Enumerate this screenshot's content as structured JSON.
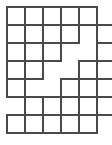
{
  "figure": {
    "name": "staircase-grid-polyomino",
    "type": "grid-puzzle",
    "background_color": "#ffffff",
    "stroke_color": "#4a4a4a",
    "cell_fill_color": "#ffffff",
    "stroke_width": 2,
    "cell_size": 18,
    "origin_x": 7,
    "origin_y": 7,
    "columns": 6,
    "rows": 7,
    "cell_count": 30,
    "cells": [
      {
        "row": 1,
        "col": 1
      },
      {
        "row": 1,
        "col": 2
      },
      {
        "row": 1,
        "col": 3
      },
      {
        "row": 1,
        "col": 4
      },
      {
        "row": 1,
        "col": 5
      },
      {
        "row": 2,
        "col": 1
      },
      {
        "row": 2,
        "col": 2
      },
      {
        "row": 2,
        "col": 3
      },
      {
        "row": 2,
        "col": 4
      },
      {
        "row": 2,
        "col": 6
      },
      {
        "row": 3,
        "col": 1
      },
      {
        "row": 3,
        "col": 2
      },
      {
        "row": 3,
        "col": 3
      },
      {
        "row": 3,
        "col": 6
      },
      {
        "row": 4,
        "col": 1
      },
      {
        "row": 4,
        "col": 2
      },
      {
        "row": 4,
        "col": 5
      },
      {
        "row": 4,
        "col": 6
      },
      {
        "row": 5,
        "col": 1
      },
      {
        "row": 5,
        "col": 4
      },
      {
        "row": 5,
        "col": 5
      },
      {
        "row": 5,
        "col": 6
      },
      {
        "row": 6,
        "col": 2
      },
      {
        "row": 6,
        "col": 3
      },
      {
        "row": 6,
        "col": 4
      },
      {
        "row": 6,
        "col": 5
      },
      {
        "row": 6,
        "col": 6
      },
      {
        "row": 7,
        "col": 1
      },
      {
        "row": 7,
        "col": 2
      },
      {
        "row": 7,
        "col": 3
      },
      {
        "row": 7,
        "col": 4
      },
      {
        "row": 7,
        "col": 5
      }
    ]
  }
}
